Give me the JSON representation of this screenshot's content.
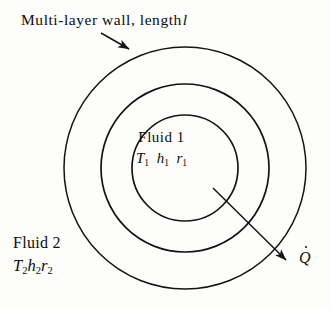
{
  "figure": {
    "title": "Multi-layer wall, length",
    "title_italic_symbol": "l",
    "background_color": "#fdfdfc",
    "line_color": "#141414"
  },
  "labels": {
    "fluid1_name": "Fluid 1",
    "fluid1_symbols": [
      {
        "base": "T",
        "sub": "1"
      },
      {
        "base": "h",
        "sub": "1"
      },
      {
        "base": "r",
        "sub": "1"
      }
    ],
    "fluid2_name": "Fluid 2",
    "fluid2_symbols": [
      {
        "base": "T",
        "sub": "2"
      },
      {
        "base": "h",
        "sub": "2"
      },
      {
        "base": "r",
        "sub": "2"
      }
    ],
    "heat_flow_symbol": "Q"
  },
  "geometry": {
    "center_x": 185,
    "center_y": 168,
    "circles": [
      {
        "name": "inner-circle",
        "radius": 53
      },
      {
        "name": "middle-circle",
        "radius": 84
      },
      {
        "name": "outer-circle",
        "radius": 121
      }
    ],
    "callout_arrow": {
      "x1": 101,
      "y1": 33,
      "x2": 129,
      "y2": 49
    },
    "heat_arrow": {
      "x1": 213,
      "y1": 188,
      "x2": 288,
      "y2": 262
    }
  }
}
